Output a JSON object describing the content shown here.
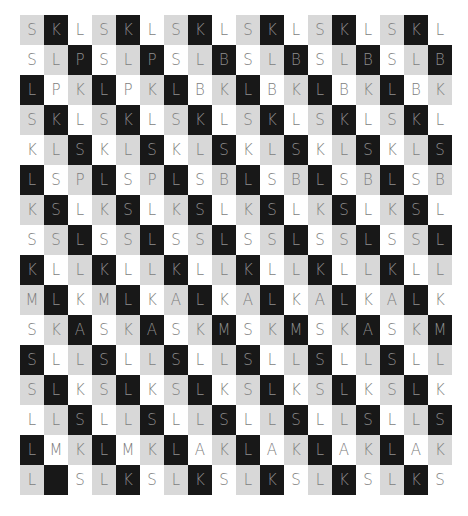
{
  "grid": {
    "columns": 18,
    "rows_count": 16,
    "colors": {
      "gray": "#d8d8d8",
      "black": "#181818",
      "white": "#ffffff",
      "text": "#7d7d7d"
    },
    "shade_rule": "shade index = (col - row) mod 3 → 0 gray, 1 black, 2 white",
    "rows": [
      [
        "S",
        "K",
        "L",
        "S",
        "K",
        "L",
        "S",
        "K",
        "L",
        "S",
        "K",
        "L",
        "S",
        "K",
        "L",
        "S",
        "K",
        "L"
      ],
      [
        "S",
        "L",
        "P",
        "S",
        "L",
        "P",
        "S",
        "L",
        "B",
        "S",
        "L",
        "B",
        "S",
        "L",
        "B",
        "S",
        "L",
        "B"
      ],
      [
        "L",
        "P",
        "K",
        "L",
        "P",
        "K",
        "L",
        "B",
        "K",
        "L",
        "B",
        "K",
        "L",
        "B",
        "K",
        "L",
        "B",
        "K"
      ],
      [
        "S",
        "K",
        "L",
        "S",
        "K",
        "L",
        "S",
        "K",
        "L",
        "S",
        "K",
        "L",
        "S",
        "K",
        "L",
        "S",
        "K",
        "L"
      ],
      [
        "K",
        "L",
        "S",
        "K",
        "L",
        "S",
        "K",
        "L",
        "S",
        "K",
        "L",
        "S",
        "K",
        "L",
        "S",
        "K",
        "L",
        "S"
      ],
      [
        "L",
        "S",
        "P",
        "L",
        "S",
        "P",
        "L",
        "S",
        "B",
        "L",
        "S",
        "B",
        "L",
        "S",
        "B",
        "L",
        "S",
        "B"
      ],
      [
        "K",
        "S",
        "L",
        "K",
        "S",
        "L",
        "K",
        "S",
        "L",
        "K",
        "S",
        "L",
        "K",
        "S",
        "L",
        "K",
        "S",
        "L"
      ],
      [
        "S",
        "S",
        "L",
        "S",
        "S",
        "L",
        "S",
        "S",
        "L",
        "S",
        "S",
        "L",
        "S",
        "S",
        "L",
        "S",
        "S",
        "L"
      ],
      [
        "K",
        "L",
        "L",
        "K",
        "L",
        "L",
        "K",
        "L",
        "L",
        "K",
        "L",
        "L",
        "K",
        "L",
        "L",
        "K",
        "L",
        "L"
      ],
      [
        "M",
        "L",
        "K",
        "M",
        "L",
        "K",
        "A",
        "L",
        "K",
        "A",
        "L",
        "K",
        "A",
        "L",
        "K",
        "A",
        "L",
        "K"
      ],
      [
        "S",
        "K",
        "A",
        "S",
        "K",
        "A",
        "S",
        "K",
        "M",
        "S",
        "K",
        "M",
        "S",
        "K",
        "A",
        "S",
        "K",
        "M"
      ],
      [
        "S",
        "L",
        "L",
        "S",
        "L",
        "L",
        "S",
        "L",
        "L",
        "S",
        "L",
        "L",
        "S",
        "L",
        "L",
        "S",
        "L",
        "L"
      ],
      [
        "S",
        "L",
        "K",
        "S",
        "L",
        "K",
        "S",
        "L",
        "K",
        "S",
        "L",
        "K",
        "S",
        "L",
        "K",
        "S",
        "L",
        "K"
      ],
      [
        "L",
        "L",
        "S",
        "L",
        "L",
        "S",
        "L",
        "L",
        "S",
        "L",
        "L",
        "S",
        "L",
        "L",
        "S",
        "L",
        "L",
        "S"
      ],
      [
        "L",
        "M",
        "K",
        "L",
        "M",
        "K",
        "L",
        "A",
        "K",
        "L",
        "A",
        "K",
        "L",
        "A",
        "K",
        "L",
        "A",
        "K"
      ],
      [
        "L",
        "",
        "S",
        "L",
        "K",
        "S",
        "L",
        "K",
        "S",
        "L",
        "K",
        "S",
        "L",
        "K",
        "S",
        "L",
        "K",
        "S"
      ]
    ]
  }
}
